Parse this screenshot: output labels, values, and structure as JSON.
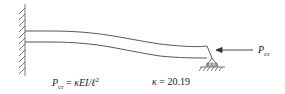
{
  "diagram": {
    "type": "fixed-pinned column buckling",
    "load_label": {
      "symbol": "P",
      "subscript": "cr"
    },
    "formula": {
      "lhs_symbol": "P",
      "lhs_subscript": "cr",
      "rhs": "κEI/ℓ",
      "rhs_superscript": "2"
    },
    "kappa": {
      "symbol": "κ",
      "value": "20.19"
    },
    "colors": {
      "line": "#444444",
      "text": "#222222"
    }
  }
}
